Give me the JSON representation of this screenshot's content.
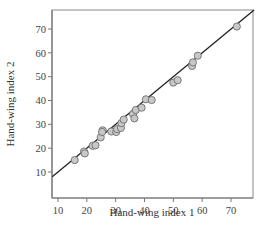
{
  "chart_data": {
    "type": "scatter",
    "title": "",
    "xlabel": "Hand-wing index 1",
    "ylabel": "Hand-wing index 2",
    "xlim": [
      8,
      78
    ],
    "ylim": [
      7,
      78
    ],
    "xticks": [
      10,
      20,
      30,
      40,
      50,
      60,
      70
    ],
    "yticks": [
      10,
      20,
      30,
      40,
      50,
      60,
      70
    ],
    "grid": false,
    "legend": null,
    "reference_line": {
      "type": "identity",
      "label": "y = x",
      "color": "#222222"
    },
    "marker": {
      "shape": "circle",
      "fill": "#c8c8c8",
      "stroke": "#6e6e6e"
    },
    "points": [
      {
        "x": 15.8,
        "y": 15.0
      },
      {
        "x": 19.0,
        "y": 18.6
      },
      {
        "x": 19.3,
        "y": 17.8
      },
      {
        "x": 22.0,
        "y": 21.0
      },
      {
        "x": 23.0,
        "y": 21.2
      },
      {
        "x": 24.8,
        "y": 24.5
      },
      {
        "x": 25.5,
        "y": 27.5
      },
      {
        "x": 25.3,
        "y": 26.8
      },
      {
        "x": 28.5,
        "y": 27.0
      },
      {
        "x": 30.2,
        "y": 26.8
      },
      {
        "x": 30.5,
        "y": 28.0
      },
      {
        "x": 31.8,
        "y": 28.5
      },
      {
        "x": 32.0,
        "y": 30.5
      },
      {
        "x": 32.8,
        "y": 32.0
      },
      {
        "x": 36.0,
        "y": 34.3
      },
      {
        "x": 37.0,
        "y": 36.0
      },
      {
        "x": 36.5,
        "y": 32.5
      },
      {
        "x": 39.0,
        "y": 37.0
      },
      {
        "x": 40.5,
        "y": 40.5
      },
      {
        "x": 42.5,
        "y": 40.2
      },
      {
        "x": 50.0,
        "y": 47.5
      },
      {
        "x": 51.5,
        "y": 48.5
      },
      {
        "x": 56.5,
        "y": 54.5
      },
      {
        "x": 56.8,
        "y": 56.0
      },
      {
        "x": 58.5,
        "y": 58.8
      },
      {
        "x": 72.0,
        "y": 71.0
      }
    ]
  },
  "axes": {
    "x_label": "Hand-wing index 1",
    "y_label": "Hand-wing index 2",
    "x_tick_labels": [
      "10",
      "20",
      "30",
      "40",
      "50",
      "60",
      "70"
    ],
    "y_tick_labels": [
      "10",
      "20",
      "30",
      "40",
      "50",
      "60",
      "70"
    ]
  }
}
